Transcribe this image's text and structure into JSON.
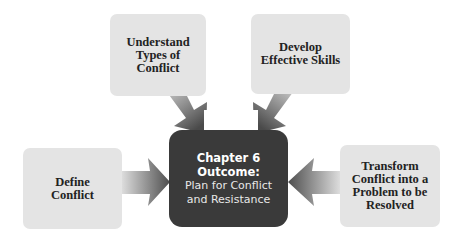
{
  "diagram": {
    "center": {
      "title_line1": "Chapter 6",
      "title_line2": "Outcome:",
      "subtitle_line1": "Plan for Conflict",
      "subtitle_line2": "and Resistance",
      "color": "#3a3a3a"
    },
    "nodes": [
      {
        "id": "understand",
        "lines": [
          "Understand",
          "Types of",
          "Conflict"
        ]
      },
      {
        "id": "develop",
        "lines": [
          "Develop",
          "Effective Skills"
        ]
      },
      {
        "id": "define",
        "lines": [
          "Define",
          "Conflict"
        ]
      },
      {
        "id": "transform",
        "lines": [
          "Transform",
          "Conflict into a",
          "Problem to be",
          "Resolved"
        ]
      }
    ],
    "colors": {
      "node_fill": "#e4e4e4",
      "arrow_dark": "#555555",
      "arrow_light": "#e0e0e0"
    }
  }
}
